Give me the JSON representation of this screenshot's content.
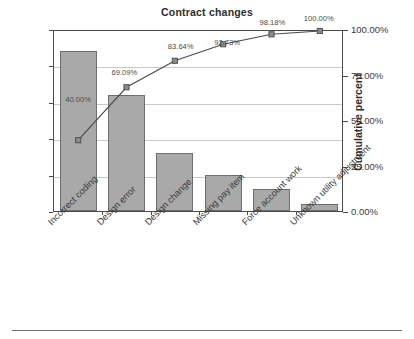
{
  "chart_data": {
    "type": "bar",
    "title": "Contract changes",
    "xlabel": "",
    "ylabel": "Frequency",
    "y2label": "Cumulative percent",
    "categories": [
      "Incorrect coding",
      "Design error",
      "Design change",
      "Missing pay item",
      "Force account work",
      "Unknown utility adjustment"
    ],
    "values": [
      22,
      16,
      8,
      5,
      3,
      1
    ],
    "cumulative_percent": [
      40.0,
      69.09,
      83.64,
      92.73,
      98.18,
      100.0
    ],
    "cumulative_percent_labels": [
      "40.00%",
      "69.09%",
      "83.64%",
      "92.73%",
      "98.18%",
      "100.00%"
    ],
    "ylim": [
      0,
      25
    ],
    "y2lim": [
      0,
      100
    ],
    "yticks": [
      0,
      5,
      10,
      15,
      20,
      25
    ],
    "ytick_labels": [
      "0",
      "5",
      "10",
      "15",
      "20",
      "25"
    ],
    "y2ticks": [
      0,
      25,
      50,
      75,
      100
    ],
    "y2tick_labels": [
      "0.00%",
      "25.00%",
      "50.00%",
      "75.00%",
      "100.00%"
    ],
    "grid": true,
    "legend": "none",
    "series": [
      {
        "name": "Frequency",
        "type": "bar",
        "values": [
          22,
          16,
          8,
          5,
          3,
          1
        ],
        "color": "#a9a9a9"
      },
      {
        "name": "Cumulative percent",
        "type": "line",
        "values": [
          40.0,
          69.09,
          83.64,
          92.73,
          98.18,
          100.0
        ],
        "color": "#4a4a4a",
        "marker": "square"
      }
    ],
    "colors": {
      "bar_fill": "#a9a9a9",
      "bar_edge": "#6e6e6e",
      "line": "#4a4a4a",
      "grid": "#c9c9c9",
      "axis": "#4a4a4a",
      "text": "#3b3b3b",
      "background": "#ffffff"
    }
  }
}
